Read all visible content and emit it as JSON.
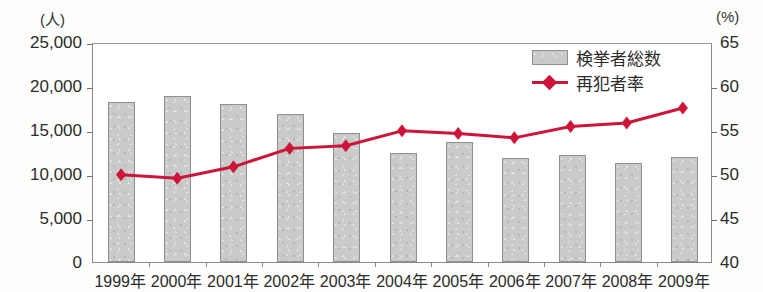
{
  "chart_data": {
    "type": "bar",
    "title": "",
    "subtitle": "",
    "xlabel": "",
    "ylabel": "(人)",
    "y2label": "(%)",
    "grid": false,
    "legend_position": "top-right",
    "categories": [
      "1999年",
      "2000年",
      "2001年",
      "2002年",
      "2003年",
      "2004年",
      "2005年",
      "2006年",
      "2007年",
      "2008年",
      "2009年"
    ],
    "ylim": [
      0,
      25000
    ],
    "yticks": [
      "0",
      "5,000",
      "10,000",
      "15,000",
      "20,000",
      "25,000"
    ],
    "ytick_values": [
      0,
      5000,
      10000,
      15000,
      20000,
      25000
    ],
    "y2lim": [
      40,
      65
    ],
    "y2ticks": [
      "40",
      "45",
      "50",
      "55",
      "60",
      "65"
    ],
    "y2tick_values": [
      40,
      45,
      50,
      55,
      60,
      65
    ],
    "series": [
      {
        "name": "検挙者総数",
        "type": "bar",
        "axis": "left",
        "color": "#c9caca",
        "values": [
          18200,
          18900,
          17900,
          16850,
          14700,
          12400,
          13600,
          11850,
          12200,
          11250,
          11900
        ]
      },
      {
        "name": "再犯者率",
        "type": "line",
        "axis": "right",
        "color": "#cc1539",
        "marker": "diamond",
        "values": [
          50.1,
          49.7,
          51.0,
          53.1,
          53.4,
          55.1,
          54.8,
          54.3,
          55.6,
          56.0,
          57.7
        ]
      }
    ]
  },
  "legend": {
    "items": [
      {
        "label": "検挙者総数",
        "swatch": "bar-swatch",
        "color": "#c9caca"
      },
      {
        "label": "再犯者率",
        "swatch": "line-diamond-swatch",
        "color": "#cc1539"
      }
    ]
  },
  "axes": {
    "left_unit": "(人)",
    "right_unit": "(%)"
  }
}
